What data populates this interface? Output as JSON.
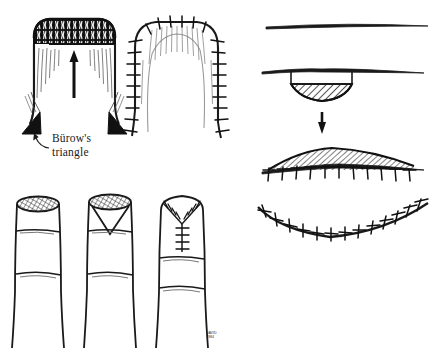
{
  "figure": {
    "background_color": "#ffffff",
    "ink_color": "#1a1a1a",
    "width": 443,
    "height": 362
  },
  "labels": {
    "burow_triangle": "Bürow's\ntriangle",
    "artist_signature": "DAVID\n1984"
  },
  "panels": {
    "top_left": {
      "name": "advancement-flap-with-burow-triangles",
      "caption_present": true,
      "arrow_direction": "up",
      "features": [
        "rectangular advancement flap",
        "hatched dark superior defect margin",
        "two solid black Bürow's triangles at flap base corners",
        "upward advancement arrow"
      ]
    },
    "top_left_right": {
      "name": "advancement-flap-sutured",
      "features": [
        "flap sutured in place",
        "interrupted sutures along both lateral limbs and superior margin"
      ]
    },
    "top_right": {
      "name": "lesion-excision-cross-section",
      "arrow_direction": "down",
      "steps": [
        "normal skin in profile",
        "hatched lesion bulging below skin surface",
        "flattened hatched mound closed with interrupted sutures"
      ]
    },
    "bottom_right": {
      "name": "curved-sutured-closure",
      "features": [
        "concave-up sutured closure line",
        "interrupted sutures along entire length"
      ]
    },
    "bottom_left": {
      "name": "fingertip-amputation-closure-sequence",
      "stages": [
        {
          "index": 1,
          "label": "open-amputation-stump",
          "description": "finger with cross-hatched transverse amputation surface"
        },
        {
          "index": 2,
          "label": "v-excision",
          "description": "V-shaped wedge marked for excision from amputation surface"
        },
        {
          "index": 3,
          "label": "y-closure-sutured",
          "description": "Y-shaped suture line closing the stump"
        }
      ]
    }
  }
}
